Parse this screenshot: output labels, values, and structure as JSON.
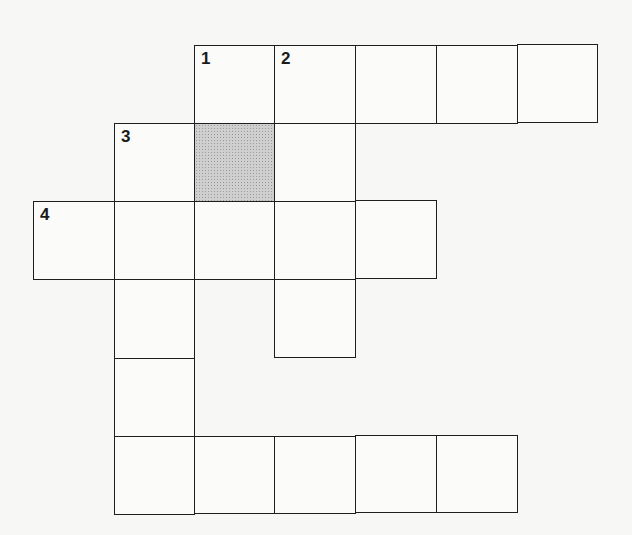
{
  "puzzle": {
    "type": "crossword",
    "cells": [
      {
        "row": 0,
        "col": 2,
        "number": "1",
        "shaded": false
      },
      {
        "row": 0,
        "col": 3,
        "number": "2",
        "shaded": false
      },
      {
        "row": 0,
        "col": 4,
        "number": "",
        "shaded": false
      },
      {
        "row": 0,
        "col": 5,
        "number": "",
        "shaded": false
      },
      {
        "row": 0,
        "col": 6,
        "number": "",
        "shaded": false
      },
      {
        "row": 1,
        "col": 1,
        "number": "3",
        "shaded": false
      },
      {
        "row": 1,
        "col": 2,
        "number": "",
        "shaded": true
      },
      {
        "row": 1,
        "col": 3,
        "number": "",
        "shaded": false
      },
      {
        "row": 2,
        "col": 0,
        "number": "4",
        "shaded": false
      },
      {
        "row": 2,
        "col": 1,
        "number": "",
        "shaded": false
      },
      {
        "row": 2,
        "col": 2,
        "number": "",
        "shaded": false
      },
      {
        "row": 2,
        "col": 3,
        "number": "",
        "shaded": false
      },
      {
        "row": 2,
        "col": 4,
        "number": "",
        "shaded": false
      },
      {
        "row": 3,
        "col": 1,
        "number": "",
        "shaded": false
      },
      {
        "row": 3,
        "col": 3,
        "number": "",
        "shaded": false
      },
      {
        "row": 4,
        "col": 1,
        "number": "",
        "shaded": false
      },
      {
        "row": 5,
        "col": 1,
        "number": "5",
        "shaded": false
      },
      {
        "row": 5,
        "col": 2,
        "number": "",
        "shaded": false
      },
      {
        "row": 5,
        "col": 3,
        "number": "",
        "shaded": false
      },
      {
        "row": 5,
        "col": 4,
        "number": "",
        "shaded": false
      },
      {
        "row": 5,
        "col": 5,
        "number": "",
        "shaded": false
      }
    ],
    "clue_numbers": [
      "1",
      "2",
      "3",
      "4",
      "5"
    ],
    "colors": {
      "grid_line": "#1e1e1e",
      "cell_bg": "#fbfbf9",
      "shaded_cell": "#cfcfcf",
      "page_bg": "#f7f7f5"
    }
  }
}
